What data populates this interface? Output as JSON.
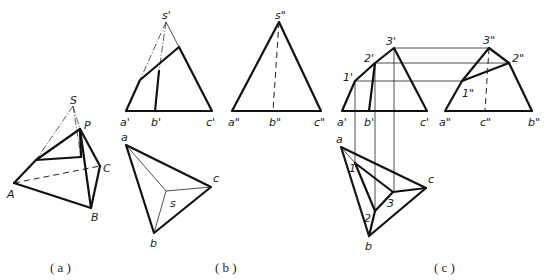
{
  "figure": {
    "panels": [
      {
        "id": "a",
        "caption": "( a )",
        "description": "Pictorial view of triangular pyramid S-ABC cut by plane through P",
        "labels": {
          "S": "S",
          "P": "P",
          "A": "A",
          "B": "B",
          "C": "C"
        }
      },
      {
        "id": "b",
        "caption": "( b )",
        "description": "Three views of pyramid",
        "front_labels": {
          "apex": "s'",
          "a": "a'",
          "b": "b'",
          "c": "c'"
        },
        "side_labels": {
          "apex": "s\"",
          "a": "a\"",
          "b": "b\"",
          "c": "c\""
        },
        "top_labels": {
          "a": "a",
          "b": "b",
          "c": "c",
          "s": "s"
        }
      },
      {
        "id": "c",
        "caption": "( c )",
        "description": "Projections of truncated pyramid with section points",
        "front_labels": {
          "p1": "1'",
          "p2": "2'",
          "p3": "3'",
          "a": "a'",
          "b": "b'",
          "c": "c'"
        },
        "side_labels": {
          "p1": "1\"",
          "p2": "2\"",
          "p3": "3\"",
          "a": "a\"",
          "c": "c\"",
          "b": "b\""
        },
        "top_labels": {
          "a": "a",
          "b": "b",
          "c": "c",
          "p1": "1",
          "p2": "2",
          "p3": "3"
        }
      }
    ]
  }
}
